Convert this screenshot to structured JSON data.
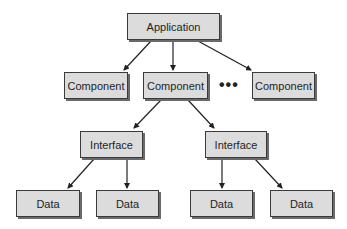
{
  "diagram": {
    "type": "hierarchy",
    "nodes": [
      {
        "id": "application",
        "label": "Application",
        "x": 127,
        "y": 13,
        "w": 93,
        "h": 27
      },
      {
        "id": "component-1",
        "label": "Component",
        "x": 64,
        "y": 72,
        "w": 64,
        "h": 27
      },
      {
        "id": "component-2",
        "label": "Component",
        "x": 143,
        "y": 72,
        "w": 65,
        "h": 27
      },
      {
        "id": "component-3",
        "label": "Component",
        "x": 252,
        "y": 72,
        "w": 63,
        "h": 27
      },
      {
        "id": "interface-1",
        "label": "Interface",
        "x": 80,
        "y": 131,
        "w": 63,
        "h": 27
      },
      {
        "id": "interface-2",
        "label": "Interface",
        "x": 205,
        "y": 131,
        "w": 62,
        "h": 27
      },
      {
        "id": "data-1",
        "label": "Data",
        "x": 16,
        "y": 190,
        "w": 64,
        "h": 27
      },
      {
        "id": "data-2",
        "label": "Data",
        "x": 96,
        "y": 190,
        "w": 63,
        "h": 27
      },
      {
        "id": "data-3",
        "label": "Data",
        "x": 190,
        "y": 190,
        "w": 63,
        "h": 27
      },
      {
        "id": "data-4",
        "label": "Data",
        "x": 270,
        "y": 190,
        "w": 63,
        "h": 27
      }
    ],
    "ellipsis": "•••",
    "edges": [
      {
        "from": "application",
        "to": "component-1"
      },
      {
        "from": "application",
        "to": "component-2"
      },
      {
        "from": "application",
        "to": "component-3"
      },
      {
        "from": "component-2",
        "to": "interface-1"
      },
      {
        "from": "component-2",
        "to": "interface-2"
      },
      {
        "from": "interface-1",
        "to": "data-1"
      },
      {
        "from": "interface-1",
        "to": "data-2"
      },
      {
        "from": "interface-2",
        "to": "data-3"
      },
      {
        "from": "interface-2",
        "to": "data-4"
      }
    ]
  }
}
